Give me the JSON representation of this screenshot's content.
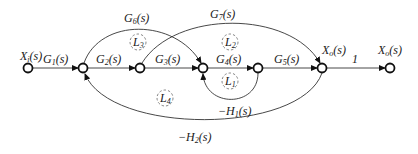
{
  "diagram": {
    "type": "signal-flow-graph",
    "nodes": [
      {
        "id": "n1",
        "label": "X",
        "sub": "i",
        "suffix": "(s)"
      },
      {
        "id": "n2",
        "label": "",
        "sub": "",
        "suffix": ""
      },
      {
        "id": "n3",
        "label": "",
        "sub": "",
        "suffix": ""
      },
      {
        "id": "n4",
        "label": "",
        "sub": "",
        "suffix": ""
      },
      {
        "id": "n5",
        "label": "",
        "sub": "",
        "suffix": ""
      },
      {
        "id": "n6",
        "label": "X",
        "sub": "o",
        "suffix": "(s)"
      },
      {
        "id": "n7",
        "label": "X",
        "sub": "o",
        "suffix": "(s)"
      }
    ],
    "edges": [
      {
        "from": "n1",
        "to": "n2",
        "gain": "G",
        "sub": "1",
        "suffix": "(s)"
      },
      {
        "from": "n2",
        "to": "n3",
        "gain": "G",
        "sub": "2",
        "suffix": "(s)"
      },
      {
        "from": "n3",
        "to": "n4",
        "gain": "G",
        "sub": "3",
        "suffix": "(s)"
      },
      {
        "from": "n4",
        "to": "n5",
        "gain": "G",
        "sub": "4",
        "suffix": "(s)"
      },
      {
        "from": "n5",
        "to": "n6",
        "gain": "G",
        "sub": "5",
        "suffix": "(s)"
      },
      {
        "from": "n2",
        "to": "n4",
        "gain": "G",
        "sub": "6",
        "suffix": "(s)"
      },
      {
        "from": "n3",
        "to": "n6",
        "gain": "G",
        "sub": "7",
        "suffix": "(s)"
      },
      {
        "from": "n5",
        "to": "n4",
        "gain": "−H",
        "sub": "1",
        "suffix": "(s)"
      },
      {
        "from": "n6",
        "to": "n2",
        "gain": "−H",
        "sub": "2",
        "suffix": "(s)"
      },
      {
        "from": "n6",
        "to": "n7",
        "gain": "1",
        "sub": "",
        "suffix": ""
      }
    ],
    "loops": [
      {
        "label": "L",
        "sub": "1"
      },
      {
        "label": "L",
        "sub": "2"
      },
      {
        "label": "L",
        "sub": "3"
      },
      {
        "label": "L",
        "sub": "4"
      }
    ]
  }
}
